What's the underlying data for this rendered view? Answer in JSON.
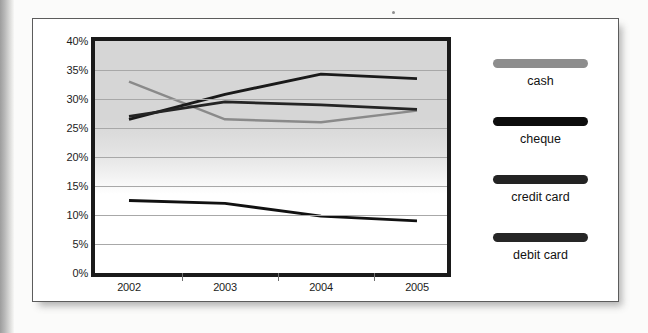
{
  "chart_data": {
    "type": "line",
    "title": "",
    "xlabel": "",
    "ylabel": "",
    "categories": [
      "2002",
      "2003",
      "2004",
      "2005"
    ],
    "x": [
      2002,
      2003,
      2004,
      2005
    ],
    "ylim": [
      0,
      40
    ],
    "yticks": [
      "0%",
      "5%",
      "10%",
      "15%",
      "20%",
      "25%",
      "30%",
      "35%",
      "40%"
    ],
    "ytick_values": [
      0,
      5,
      10,
      15,
      20,
      25,
      30,
      35,
      40
    ],
    "grid": true,
    "legend_position": "right",
    "series": [
      {
        "name": "cash",
        "color": "#8a8a8a",
        "values": [
          33.0,
          26.5,
          26.0,
          28.0
        ]
      },
      {
        "name": "cheque",
        "color": "#111111",
        "values": [
          12.5,
          12.0,
          9.8,
          9.0
        ]
      },
      {
        "name": "credit card",
        "color": "#1a1a1a",
        "values": [
          26.5,
          30.8,
          34.3,
          33.5
        ]
      },
      {
        "name": "debit card",
        "color": "#242424",
        "values": [
          27.0,
          29.5,
          29.0,
          28.2
        ]
      }
    ]
  },
  "legend": {
    "entries": [
      {
        "label": "cash",
        "swatch_color": "#8d8d8d"
      },
      {
        "label": "cheque",
        "swatch_color": "#0d0d0d"
      },
      {
        "label": "credit card",
        "swatch_color": "#232323"
      },
      {
        "label": "debit card",
        "swatch_color": "#262626"
      }
    ]
  },
  "axis": {
    "y_labels": [
      "40%",
      "35%",
      "30%",
      "25%",
      "20%",
      "15%",
      "10%",
      "5%",
      "0%"
    ],
    "x_labels": [
      "2002",
      "2003",
      "2004",
      "2005"
    ]
  },
  "colors": {
    "plot_border": "#1a1a1a",
    "gridline": "#a8a8a8",
    "card_background": "#ffffff",
    "page_background": "#fbfbfa"
  }
}
